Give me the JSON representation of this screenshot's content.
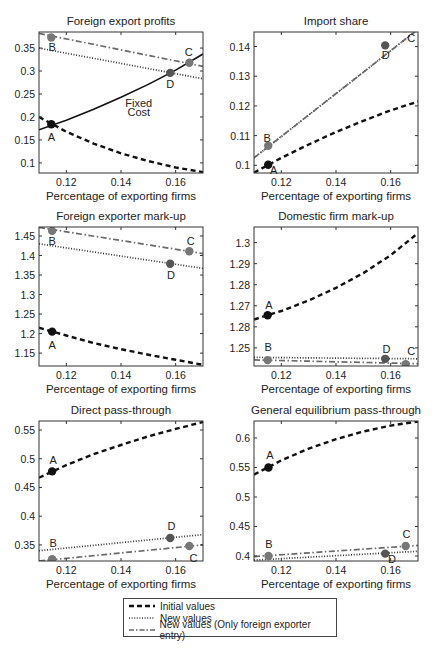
{
  "chart_data": [
    {
      "type": "line",
      "title": "Foreign export profits",
      "xlabel": "Percentage of exporting firms",
      "ylabel": "",
      "xlim": [
        0.11,
        0.17
      ],
      "ylim": [
        0.078,
        0.385
      ],
      "xticks": [
        0.12,
        0.14,
        0.16
      ],
      "xtick_labels": [
        "0.12",
        "0.14",
        "0.16"
      ],
      "yticks": [
        0.1,
        0.15,
        0.2,
        0.25,
        0.3,
        0.35
      ],
      "ytick_labels": [
        "0.1",
        "0.15",
        "0.2",
        "0.25",
        "0.3",
        "0.35"
      ],
      "series": [
        {
          "name": "Initial values",
          "style": "dashed",
          "x": [
            0.11,
            0.12,
            0.13,
            0.14,
            0.15,
            0.16,
            0.17
          ],
          "y": [
            0.2,
            0.168,
            0.142,
            0.121,
            0.104,
            0.09,
            0.08
          ]
        },
        {
          "name": "New values",
          "style": "dotted",
          "x": [
            0.11,
            0.17
          ],
          "y": [
            0.35,
            0.283
          ]
        },
        {
          "name": "New values (Only foreign exporter entry)",
          "style": "dashdot",
          "x": [
            0.11,
            0.17
          ],
          "y": [
            0.382,
            0.31
          ]
        },
        {
          "name": "Fixed Cost",
          "style": "solid",
          "x": [
            0.11,
            0.12,
            0.13,
            0.14,
            0.15,
            0.16,
            0.17
          ],
          "y": [
            0.172,
            0.193,
            0.217,
            0.243,
            0.271,
            0.302,
            0.337
          ]
        }
      ],
      "points": [
        {
          "label": "A",
          "x": 0.1145,
          "y": 0.184,
          "color": "#111111",
          "lx": 0.1145,
          "ly": 0.156
        },
        {
          "label": "B",
          "x": 0.1145,
          "y": 0.373,
          "color": "#777777",
          "lx": 0.1148,
          "ly": 0.352
        },
        {
          "label": "C",
          "x": 0.165,
          "y": 0.318,
          "color": "#777777",
          "lx": 0.1648,
          "ly": 0.342
        },
        {
          "label": "D",
          "x": 0.158,
          "y": 0.296,
          "color": "#555555",
          "lx": 0.158,
          "ly": 0.272
        }
      ],
      "annotations": [
        {
          "text": "Fixed",
          "x": 0.1465,
          "y": 0.23
        },
        {
          "text": "Cost",
          "x": 0.1465,
          "y": 0.21
        }
      ]
    },
    {
      "type": "line",
      "title": "Import share",
      "xlabel": "Percentage of exporting firms",
      "ylabel": "",
      "xlim": [
        0.11,
        0.17
      ],
      "ylim": [
        0.0974,
        0.1449
      ],
      "xticks": [
        0.12,
        0.14,
        0.16
      ],
      "xtick_labels": [
        "0.12",
        "0.14",
        "0.16"
      ],
      "yticks": [
        0.1,
        0.11,
        0.12,
        0.13,
        0.14
      ],
      "ytick_labels": [
        "0.1",
        "0.11",
        "0.12",
        "0.13",
        "0.14"
      ],
      "series": [
        {
          "name": "Initial values",
          "style": "dashed",
          "x": [
            0.11,
            0.12,
            0.13,
            0.14,
            0.15,
            0.16,
            0.17
          ],
          "y": [
            0.0975,
            0.1025,
            0.107,
            0.1112,
            0.115,
            0.1185,
            0.1215
          ]
        },
        {
          "name": "New values",
          "style": "dotted",
          "x": [
            0.11,
            0.17
          ],
          "y": [
            0.1025,
            0.1458
          ]
        },
        {
          "name": "New values (Only foreign exporter entry)",
          "style": "dashdot",
          "x": [
            0.11,
            0.17
          ],
          "y": [
            0.1025,
            0.1458
          ]
        }
      ],
      "points": [
        {
          "label": "A",
          "x": 0.1152,
          "y": 0.1002,
          "color": "#111111",
          "lx": 0.1172,
          "ly": 0.0985
        },
        {
          "label": "B",
          "x": 0.1152,
          "y": 0.1066,
          "color": "#777777",
          "lx": 0.1148,
          "ly": 0.1093
        },
        {
          "label": "C",
          "x": 0.1655,
          "y": 0.1462,
          "color": "#777777",
          "lx": 0.1675,
          "ly": 0.143
        },
        {
          "label": "D",
          "x": 0.158,
          "y": 0.1404,
          "color": "#555555",
          "lx": 0.1582,
          "ly": 0.137
        }
      ],
      "annotations": []
    },
    {
      "type": "line",
      "title": "Foreign exporter mark-up",
      "xlabel": "Percentage of exporting firms",
      "ylabel": "",
      "xlim": [
        0.11,
        0.17
      ],
      "ylim": [
        1.117,
        1.473
      ],
      "xticks": [
        0.12,
        0.14,
        0.16
      ],
      "xtick_labels": [
        "0.12",
        "0.14",
        "0.16"
      ],
      "yticks": [
        1.15,
        1.2,
        1.25,
        1.3,
        1.35,
        1.4,
        1.45
      ],
      "ytick_labels": [
        "1.15",
        "1.2",
        "1.25",
        "1.3",
        "1.35",
        "1.4",
        "1.45"
      ],
      "series": [
        {
          "name": "Initial values",
          "style": "dashed",
          "x": [
            0.11,
            0.12,
            0.13,
            0.14,
            0.15,
            0.16,
            0.17
          ],
          "y": [
            1.215,
            1.195,
            1.176,
            1.16,
            1.146,
            1.133,
            1.12
          ]
        },
        {
          "name": "New values",
          "style": "dotted",
          "x": [
            0.11,
            0.17
          ],
          "y": [
            1.43,
            1.367
          ]
        },
        {
          "name": "New values (Only foreign exporter entry)",
          "style": "dashdot",
          "x": [
            0.11,
            0.17
          ],
          "y": [
            1.472,
            1.405
          ]
        }
      ],
      "points": [
        {
          "label": "A",
          "x": 0.1148,
          "y": 1.205,
          "color": "#111111",
          "lx": 0.1148,
          "ly": 1.172
        },
        {
          "label": "B",
          "x": 0.1148,
          "y": 1.463,
          "color": "#777777",
          "lx": 0.1148,
          "ly": 1.438
        },
        {
          "label": "C",
          "x": 0.165,
          "y": 1.411,
          "color": "#777777",
          "lx": 0.1655,
          "ly": 1.437
        },
        {
          "label": "D",
          "x": 0.158,
          "y": 1.379,
          "color": "#555555",
          "lx": 0.1583,
          "ly": 1.35
        }
      ],
      "annotations": []
    },
    {
      "type": "line",
      "title": "Domestic firm mark-up",
      "xlabel": "Percentage of exporting firms",
      "ylabel": "",
      "xlim": [
        0.11,
        0.17
      ],
      "ylim": [
        1.2414,
        1.3074
      ],
      "xticks": [
        0.12,
        0.14,
        0.16
      ],
      "xtick_labels": [
        "0.12",
        "0.14",
        "0.16"
      ],
      "yticks": [
        1.25,
        1.26,
        1.27,
        1.28,
        1.29,
        1.3
      ],
      "ytick_labels": [
        "1.25",
        "1.28",
        "1.27",
        "1.28",
        "1.29",
        "1.3"
      ],
      "series": [
        {
          "name": "Initial values",
          "style": "dashed",
          "x": [
            0.11,
            0.12,
            0.13,
            0.14,
            0.15,
            0.16,
            0.17
          ],
          "y": [
            1.2635,
            1.2675,
            1.2725,
            1.2785,
            1.2855,
            1.294,
            1.3045
          ]
        },
        {
          "name": "New values",
          "style": "dotted",
          "x": [
            0.11,
            0.17
          ],
          "y": [
            1.2455,
            1.2448
          ]
        },
        {
          "name": "New values (Only foreign exporter entry)",
          "style": "dashdot",
          "x": [
            0.11,
            0.17
          ],
          "y": [
            1.2443,
            1.2425
          ]
        }
      ],
      "points": [
        {
          "label": "A",
          "x": 0.115,
          "y": 1.2655,
          "color": "#111111",
          "lx": 0.1155,
          "ly": 1.2705
        },
        {
          "label": "B",
          "x": 0.115,
          "y": 1.2442,
          "color": "#777777",
          "lx": 0.1152,
          "ly": 1.2505
        },
        {
          "label": "D",
          "x": 0.158,
          "y": 1.2448,
          "color": "#555555",
          "lx": 0.1585,
          "ly": 1.2497
        },
        {
          "label": "C",
          "x": 0.1655,
          "y": 1.2423,
          "color": "#777777",
          "lx": 0.1675,
          "ly": 1.2485
        }
      ],
      "annotations": []
    },
    {
      "type": "line",
      "title": "Direct pass-through",
      "xlabel": "Percentage of exporting firms",
      "ylabel": "",
      "xlim": [
        0.11,
        0.17
      ],
      "ylim": [
        0.322,
        0.5657
      ],
      "xticks": [
        0.12,
        0.14,
        0.16
      ],
      "xtick_labels": [
        "0.12",
        "0.14",
        "0.16"
      ],
      "yticks": [
        0.35,
        0.4,
        0.45,
        0.5,
        0.55
      ],
      "ytick_labels": [
        "0.35",
        "0.4",
        "0.45",
        "0.5",
        "0.55"
      ],
      "series": [
        {
          "name": "Initial values",
          "style": "dashed",
          "x": [
            0.11,
            0.12,
            0.13,
            0.14,
            0.15,
            0.16,
            0.17
          ],
          "y": [
            0.467,
            0.489,
            0.508,
            0.524,
            0.539,
            0.552,
            0.564
          ]
        },
        {
          "name": "New values",
          "style": "dotted",
          "x": [
            0.11,
            0.17
          ],
          "y": [
            0.34,
            0.368
          ]
        },
        {
          "name": "New values (Only foreign exporter entry)",
          "style": "dashdot",
          "x": [
            0.11,
            0.17
          ],
          "y": [
            0.322,
            0.35
          ]
        }
      ],
      "points": [
        {
          "label": "A",
          "x": 0.1148,
          "y": 0.478,
          "color": "#111111",
          "lx": 0.1152,
          "ly": 0.498
        },
        {
          "label": "B",
          "x": 0.1148,
          "y": 0.325,
          "color": "#777777",
          "lx": 0.1152,
          "ly": 0.354
        },
        {
          "label": "D",
          "x": 0.158,
          "y": 0.362,
          "color": "#555555",
          "lx": 0.1585,
          "ly": 0.383
        },
        {
          "label": "C",
          "x": 0.165,
          "y": 0.348,
          "color": "#777777",
          "lx": 0.1665,
          "ly": 0.327
        }
      ],
      "annotations": []
    },
    {
      "type": "line",
      "title": "General equilibrium pass-through",
      "xlabel": "Percentage of exporting firms",
      "ylabel": "",
      "xlim": [
        0.11,
        0.17
      ],
      "ylim": [
        0.3915,
        0.6288
      ],
      "xticks": [
        0.12,
        0.14,
        0.16
      ],
      "xtick_labels": [
        "0.12",
        "0.14",
        "0.16"
      ],
      "yticks": [
        0.4,
        0.45,
        0.5,
        0.55,
        0.6
      ],
      "ytick_labels": [
        "0.4",
        "0.45",
        "0.5",
        "0.55",
        "0.6"
      ],
      "series": [
        {
          "name": "Initial values",
          "style": "dashed",
          "x": [
            0.11,
            0.12,
            0.13,
            0.14,
            0.15,
            0.16,
            0.17
          ],
          "y": [
            0.538,
            0.562,
            0.582,
            0.598,
            0.611,
            0.621,
            0.628
          ]
        },
        {
          "name": "New values",
          "style": "dotted",
          "x": [
            0.11,
            0.17
          ],
          "y": [
            0.393,
            0.408
          ]
        },
        {
          "name": "New values (Only foreign exporter entry)",
          "style": "dashdot",
          "x": [
            0.11,
            0.17
          ],
          "y": [
            0.399,
            0.418
          ]
        }
      ],
      "points": [
        {
          "label": "A",
          "x": 0.1153,
          "y": 0.55,
          "color": "#111111",
          "lx": 0.1158,
          "ly": 0.571
        },
        {
          "label": "B",
          "x": 0.1153,
          "y": 0.4,
          "color": "#777777",
          "lx": 0.1155,
          "ly": 0.421
        },
        {
          "label": "C",
          "x": 0.1655,
          "y": 0.417,
          "color": "#777777",
          "lx": 0.1658,
          "ly": 0.438
        },
        {
          "label": "D",
          "x": 0.158,
          "y": 0.404,
          "color": "#555555",
          "lx": 0.1605,
          "ly": 0.395
        }
      ],
      "annotations": []
    }
  ],
  "layout": {
    "panels": [
      {
        "left": 39,
        "top": 32,
        "width": 164,
        "height": 141
      },
      {
        "left": 254,
        "top": 32,
        "width": 164,
        "height": 141
      },
      {
        "left": 39,
        "top": 227,
        "width": 164,
        "height": 139
      },
      {
        "left": 254,
        "top": 227,
        "width": 164,
        "height": 139
      },
      {
        "left": 39,
        "top": 421,
        "width": 164,
        "height": 140
      },
      {
        "left": 254,
        "top": 421,
        "width": 164,
        "height": 140
      }
    ]
  },
  "legend": {
    "entries": [
      {
        "label": "Initial values",
        "style": "dashed"
      },
      {
        "label": "New values",
        "style": "dotted"
      },
      {
        "label": "New values (Only foreign exporter entry)",
        "style": "dashdot"
      }
    ]
  }
}
